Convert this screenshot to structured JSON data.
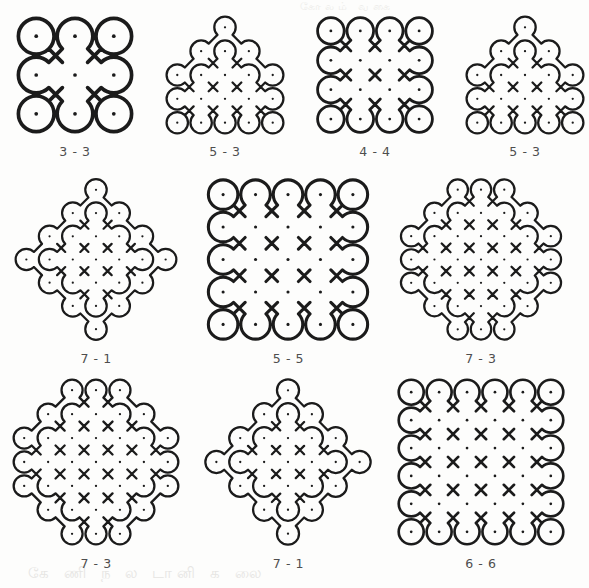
{
  "page": {
    "background_color": "#fdfdfc",
    "stroke_color": "#1b1b1b",
    "dot_color": "#1b1b1b",
    "caption_color": "#4e4e4e",
    "ghost_text_bottom": "கே  ணி   ந ல டானி  க  லை",
    "ghost_text_top": "கோலம்  வகை"
  },
  "figures": [
    {
      "id": "fig-1",
      "caption": "3 - 3",
      "grid_type": "square",
      "rows": [
        3,
        3,
        3
      ],
      "spacing": 37,
      "loop_radius": 17,
      "width": 150,
      "height": 130
    },
    {
      "id": "fig-2",
      "caption": "5 - 3",
      "grid_type": "stepped-pyramid",
      "rows": [
        1,
        3,
        5,
        5,
        5
      ],
      "spacing": 29,
      "loop_radius": 13,
      "width": 150,
      "height": 130
    },
    {
      "id": "fig-3",
      "caption": "4 - 4",
      "grid_type": "square",
      "rows": [
        4,
        4,
        4,
        4
      ],
      "spacing": 31,
      "loop_radius": 14,
      "width": 150,
      "height": 130
    },
    {
      "id": "fig-4",
      "caption": "5 - 3",
      "grid_type": "pyramid",
      "rows": [
        1,
        3,
        5,
        5,
        5
      ],
      "spacing": 29,
      "loop_radius": 13,
      "width": 150,
      "height": 130
    },
    {
      "id": "fig-5",
      "caption": "7 - 1",
      "grid_type": "diamond",
      "rows": [
        1,
        3,
        5,
        7,
        5,
        3,
        1
      ],
      "spacing": 26,
      "loop_radius": 12,
      "width": 190,
      "height": 175
    },
    {
      "id": "fig-6",
      "caption": "5 - 5",
      "grid_type": "square",
      "rows": [
        5,
        5,
        5,
        5,
        5
      ],
      "spacing": 33,
      "loop_radius": 15,
      "width": 190,
      "height": 175
    },
    {
      "id": "fig-7",
      "caption": "7 - 3",
      "grid_type": "octagon",
      "rows": [
        3,
        5,
        7,
        7,
        7,
        5,
        3
      ],
      "spacing": 25,
      "loop_radius": 11,
      "width": 190,
      "height": 175
    },
    {
      "id": "fig-8",
      "caption": "7 - 3",
      "grid_type": "octagon",
      "rows": [
        3,
        5,
        7,
        7,
        7,
        5,
        3
      ],
      "spacing": 25,
      "loop_radius": 11,
      "width": 190,
      "height": 180
    },
    {
      "id": "fig-9",
      "caption": "7 - 1",
      "grid_type": "diamond",
      "rows": [
        1,
        3,
        5,
        7,
        5,
        3,
        1
      ],
      "spacing": 26,
      "loop_radius": 12,
      "width": 190,
      "height": 180
    },
    {
      "id": "fig-10",
      "caption": "6 - 6",
      "grid_type": "square",
      "rows": [
        6,
        6,
        6,
        6,
        6,
        6
      ],
      "spacing": 29,
      "loop_radius": 13,
      "width": 190,
      "height": 180
    }
  ],
  "layout": {
    "rows": [
      {
        "top": 10,
        "figure_ids": [
          "fig-1",
          "fig-2",
          "fig-3",
          "fig-4"
        ]
      },
      {
        "top": 172,
        "figure_ids": [
          "fig-5",
          "fig-6",
          "fig-7"
        ]
      },
      {
        "top": 372,
        "figure_ids": [
          "fig-8",
          "fig-9",
          "fig-10"
        ]
      }
    ]
  }
}
